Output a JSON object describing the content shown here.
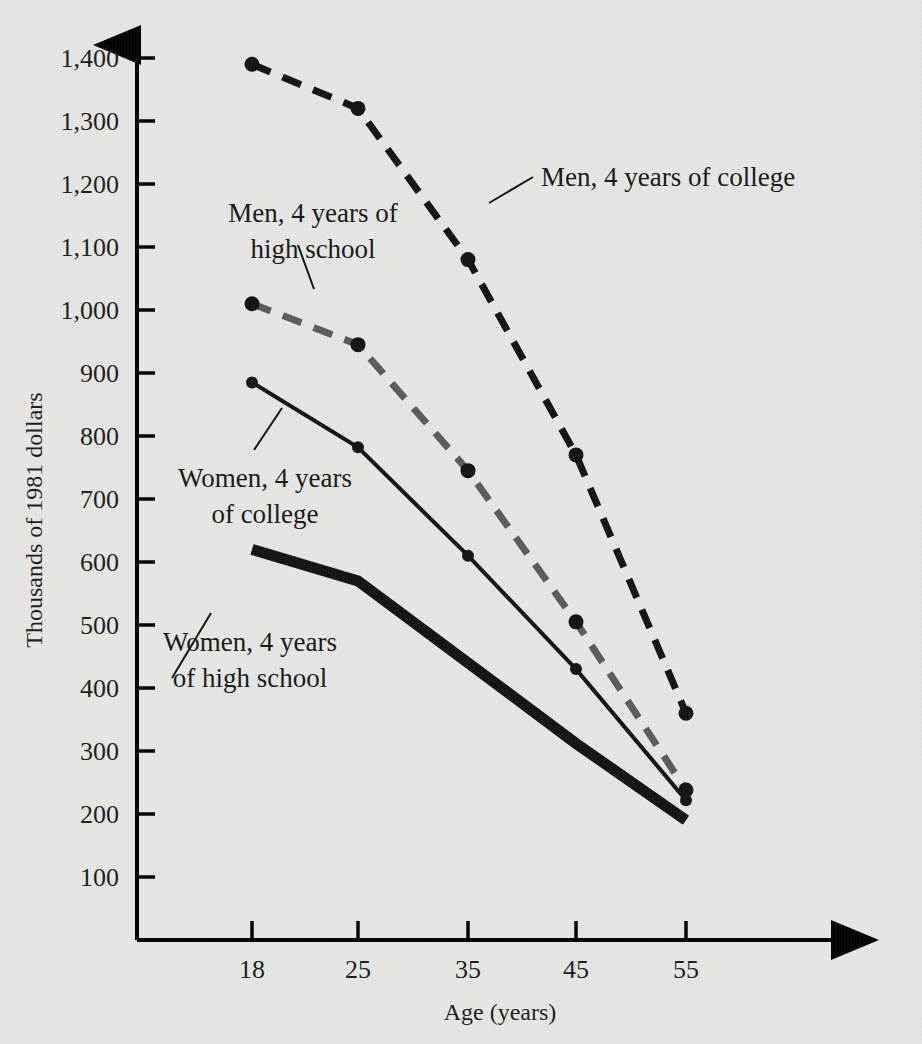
{
  "figure": {
    "background_color": "#e7e7e6",
    "ink_color": "#111111",
    "gray_series_color": "#5a5a5a"
  },
  "axes": {
    "y_axis_title": "Thousands of 1981 dollars",
    "x_axis_title": "Age (years)",
    "y_ticks": [
      "100",
      "200",
      "300",
      "400",
      "500",
      "600",
      "700",
      "800",
      "900",
      "1,000",
      "1,100",
      "1,200",
      "1,300",
      "1,400"
    ],
    "x_ticks": [
      "18",
      "25",
      "35",
      "45",
      "55"
    ]
  },
  "annotations": {
    "men_college": "Men, 4 years of college",
    "men_highschool_line1": "Men, 4 years of",
    "men_highschool_line2": "high school",
    "women_college_line1": "Women, 4 years",
    "women_college_line2": "of college",
    "women_highschool_line1": "Women, 4 years",
    "women_highschool_line2": "of high school"
  },
  "chart_data": {
    "type": "line",
    "title": "",
    "xlabel": "Age (years)",
    "ylabel": "Thousands of 1981 dollars",
    "x": [
      18,
      25,
      35,
      45,
      55
    ],
    "xlim": [
      14,
      60
    ],
    "ylim": [
      0,
      1450
    ],
    "x_tick_labels": [
      "18",
      "25",
      "35",
      "45",
      "55"
    ],
    "y_tick_values": [
      100,
      200,
      300,
      400,
      500,
      600,
      700,
      800,
      900,
      1000,
      1100,
      1200,
      1300,
      1400
    ],
    "y_tick_labels": [
      "100",
      "200",
      "300",
      "400",
      "500",
      "600",
      "700",
      "800",
      "900",
      "1,000",
      "1,100",
      "1,200",
      "1,300",
      "1,400"
    ],
    "grid": false,
    "legend": "inline-annotations",
    "series": [
      {
        "name": "Men, 4 years of college",
        "style": "dashed",
        "color": "#111111",
        "line_width": 7,
        "markers": true,
        "values": [
          1390,
          1320,
          1080,
          770,
          360
        ]
      },
      {
        "name": "Men, 4 years of high school",
        "style": "dashed",
        "color": "#5a5a5a",
        "line_width": 7,
        "markers": true,
        "values": [
          1010,
          945,
          745,
          505,
          238
        ]
      },
      {
        "name": "Women, 4 years of college",
        "style": "solid",
        "color": "#111111",
        "line_width": 4,
        "markers": true,
        "values": [
          885,
          782,
          610,
          430,
          222
        ]
      },
      {
        "name": "Women, 4 years of high school",
        "style": "solid-thick",
        "color": "#111111",
        "line_width": 11,
        "markers": false,
        "values": [
          620,
          570,
          440,
          312,
          190
        ]
      }
    ]
  }
}
